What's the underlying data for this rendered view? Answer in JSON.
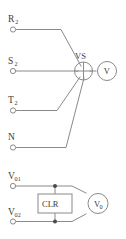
{
  "diagram": {
    "colors": {
      "wire": "#8a8a8a",
      "text": "#3d3d3d",
      "node": "#4a4a4a",
      "background": "#ffffff"
    },
    "upper_circuit": {
      "terminals": [
        {
          "id": "r2",
          "base": "R",
          "sub": "2"
        },
        {
          "id": "s2",
          "base": "S",
          "sub": "2"
        },
        {
          "id": "t2",
          "base": "T",
          "sub": "2"
        },
        {
          "id": "n",
          "base": "N",
          "sub": ""
        }
      ],
      "selector": {
        "id": "vs",
        "label": "VS"
      },
      "meter": {
        "id": "v",
        "label": "V"
      }
    },
    "lower_circuit": {
      "terminals": [
        {
          "id": "v01",
          "base": "V",
          "sub": "01"
        },
        {
          "id": "v02",
          "base": "V",
          "sub": "02"
        }
      ],
      "component": {
        "id": "clr",
        "label": "CLR"
      },
      "meter": {
        "base": "V",
        "sub": "0"
      }
    }
  }
}
